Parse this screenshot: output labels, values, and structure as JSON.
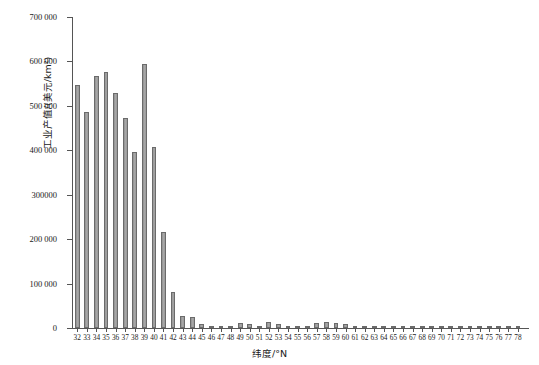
{
  "chart_data": {
    "type": "bar",
    "title": "",
    "xlabel": "纬度/°N",
    "ylabel": "工业产值/(美元/km²)",
    "ylim": [
      0,
      700000
    ],
    "xlim": [
      31.5,
      78.5
    ],
    "grid": false,
    "legend": null,
    "ytick_labels": [
      "0",
      "100 000",
      "200 000",
      "300000",
      "400 000",
      "500 000",
      "600 000",
      "700 000"
    ],
    "ytick_values": [
      0,
      100000,
      200000,
      300000,
      400000,
      500000,
      600000,
      700000
    ],
    "bar_color": "#9a9a9a",
    "bar_edge_color": "#6b6b6b",
    "axis_color": "#555555",
    "categories": [
      "32",
      "33",
      "34",
      "35",
      "36",
      "37",
      "38",
      "39",
      "40",
      "41",
      "42",
      "43",
      "44",
      "45",
      "46",
      "47",
      "48",
      "49",
      "50",
      "51",
      "52",
      "53",
      "54",
      "55",
      "56",
      "57",
      "58",
      "59",
      "60",
      "61",
      "62",
      "63",
      "64",
      "65",
      "66",
      "67",
      "68",
      "69",
      "70",
      "71",
      "72",
      "73",
      "74",
      "75",
      "76",
      "77",
      "78"
    ],
    "values": [
      548000,
      487000,
      568000,
      576000,
      530000,
      472000,
      397000,
      594000,
      408000,
      215000,
      82000,
      27000,
      25000,
      9000,
      5000,
      4000,
      3000,
      11000,
      10000,
      4000,
      13000,
      9000,
      4000,
      3000,
      4000,
      12000,
      13000,
      11000,
      8000,
      4000,
      2000,
      1500,
      1200,
      1000,
      900,
      800,
      700,
      600,
      600,
      500,
      500,
      400,
      400,
      300,
      300,
      300,
      300
    ]
  }
}
